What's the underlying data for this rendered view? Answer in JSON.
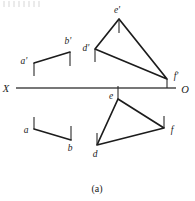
{
  "figure": {
    "caption": "(a)",
    "axis": {
      "left_label": "X",
      "right_label": "O",
      "y": 88,
      "x_start": 16,
      "x_end": 176
    },
    "colors": {
      "ink": "#1c1c1c",
      "ground_line": "#4a4a4a",
      "background": "#ffffff"
    },
    "front_view": {
      "name": "front-view",
      "segment": {
        "name": "segment-ab-front",
        "points": [
          {
            "label": "a'",
            "x": 34,
            "y": 63,
            "label_x": 24,
            "label_y": 63
          },
          {
            "label": "b'",
            "x": 70,
            "y": 52,
            "label_x": 67,
            "label_y": 43
          }
        ]
      },
      "triangle": {
        "name": "triangle-def-front",
        "points": [
          {
            "label": "d'",
            "x": 95,
            "y": 49,
            "label_x": 85,
            "label_y": 49
          },
          {
            "label": "e'",
            "x": 119,
            "y": 19,
            "label_x": 115,
            "label_y": 12
          },
          {
            "label": "f'",
            "x": 167,
            "y": 79,
            "label_x": 172,
            "label_y": 76
          }
        ]
      }
    },
    "top_view": {
      "name": "top-view",
      "segment": {
        "name": "segment-ab-top",
        "points": [
          {
            "label": "a",
            "x": 34,
            "y": 129,
            "label_x": 25,
            "label_y": 132
          },
          {
            "label": "b",
            "x": 71,
            "y": 140,
            "label_x": 69,
            "label_y": 150
          }
        ]
      },
      "triangle": {
        "name": "triangle-def-top",
        "points": [
          {
            "label": "e",
            "x": 118,
            "y": 99,
            "label_x": 112,
            "label_y": 97
          },
          {
            "label": "f",
            "x": 164,
            "y": 128,
            "label_x": 169,
            "label_y": 132
          },
          {
            "label": "d",
            "x": 97,
            "y": 145,
            "label_x": 93,
            "label_y": 156
          }
        ]
      }
    }
  }
}
